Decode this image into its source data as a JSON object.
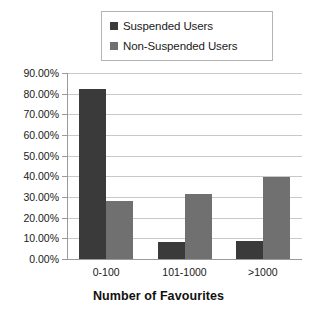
{
  "chart_data": {
    "type": "bar",
    "title": "",
    "xlabel": "Number of Favourites",
    "ylabel": "",
    "categories": [
      "0-100",
      "101-1000",
      ">1000"
    ],
    "series": [
      {
        "name": "Suspended Users",
        "color": "#3a3a3a",
        "values": [
          82.5,
          8.0,
          8.6
        ]
      },
      {
        "name": "Non-Suspended Users",
        "color": "#707070",
        "values": [
          28.0,
          31.3,
          39.8
        ]
      }
    ],
    "ylim": [
      0,
      90
    ],
    "ytick_values": [
      0,
      10,
      20,
      30,
      40,
      50,
      60,
      70,
      80,
      90
    ],
    "ytick_labels": [
      "0.00%",
      "10.00%",
      "20.00%",
      "30.00%",
      "40.00%",
      "50.00%",
      "60.00%",
      "70.00%",
      "80.00%",
      "90.00%"
    ],
    "grid": true,
    "legend_position": "top-center",
    "value_format": "percent"
  },
  "legend": {
    "entries": [
      {
        "label": "Suspended Users",
        "color": "#3a3a3a"
      },
      {
        "label": "Non-Suspended Users",
        "color": "#707070"
      }
    ]
  },
  "axis": {
    "x_title": "Number of Favourites"
  },
  "colors": {
    "background": "#ffffff",
    "gridline": "#c8c8c8",
    "axis": "#9a9a9a",
    "text": "#1a1a1a",
    "legend_border": "#b4b4b4",
    "series_1": "#3a3a3a",
    "series_2": "#707070"
  }
}
